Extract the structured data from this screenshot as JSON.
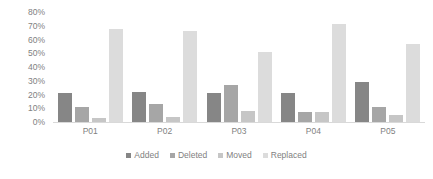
{
  "chart_data": {
    "type": "bar",
    "title": "",
    "xlabel": "",
    "ylabel": "",
    "categories": [
      "P01",
      "P02",
      "P03",
      "P04",
      "P05"
    ],
    "series": [
      {
        "name": "Added",
        "color": "#868686",
        "values": [
          21,
          22,
          21,
          21,
          29
        ]
      },
      {
        "name": "Deleted",
        "color": "#a6a6a6",
        "values": [
          11,
          13,
          27,
          7,
          11
        ]
      },
      {
        "name": "Moved",
        "color": "#c6c6c6",
        "values": [
          3,
          4,
          8,
          7,
          5
        ]
      },
      {
        "name": "Replaced",
        "color": "#dcdcdc",
        "values": [
          68,
          66,
          51,
          71,
          57
        ]
      }
    ],
    "ylim": [
      0,
      80
    ],
    "y_ticks": [
      "0%",
      "10%",
      "20%",
      "30%",
      "40%",
      "50%",
      "60%",
      "70%",
      "80%"
    ],
    "y_tick_values": [
      0,
      10,
      20,
      30,
      40,
      50,
      60,
      70,
      80
    ],
    "grid": false,
    "legend_position": "bottom",
    "axis_text_color": "#7f7f7f",
    "baseline_color": "#d9d9d9",
    "background_color": "#ffffff"
  }
}
